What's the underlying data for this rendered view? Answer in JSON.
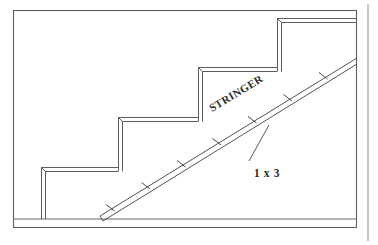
{
  "diagram": {
    "type": "architectural-section",
    "canvas": {
      "width": 378,
      "height": 245,
      "background": "#ffffff"
    },
    "labels": {
      "stringer": "STRINGER",
      "lumber_size": "1 x 3"
    },
    "colors": {
      "frame": "#5d5d5d",
      "page_rule": "#9a9a9a",
      "floor": "#6b6b6b",
      "step_board": "#4a4a4a",
      "stringer": "#3f3f3f",
      "tick": "#2f2f2f",
      "text": "#2b2b2b"
    },
    "frame": {
      "x": 13,
      "y": 10,
      "width": 344,
      "height": 218
    },
    "page_rule": {
      "x": 368,
      "y1": 4,
      "y2": 241
    },
    "floor": {
      "x1": 14,
      "x2": 356,
      "y": 219
    },
    "steps": [
      {
        "name": "step-1",
        "riser_x": 41,
        "riser_top": 167,
        "riser_bottom": 219,
        "tread_y": 167,
        "tread_x2": 118
      },
      {
        "name": "step-2",
        "riser_x": 118,
        "riser_top": 117,
        "riser_bottom": 167,
        "tread_y": 117,
        "tread_x2": 198
      },
      {
        "name": "step-3",
        "riser_x": 198,
        "riser_top": 67,
        "riser_bottom": 117,
        "tread_y": 67,
        "tread_x2": 277
      },
      {
        "name": "step-4",
        "riser_x": 277,
        "riser_top": 18,
        "riser_bottom": 67,
        "tread_y": 18,
        "tread_x2": 357
      }
    ],
    "board_thickness_px": 4,
    "stringer": {
      "start": {
        "x": 100,
        "y": 220
      },
      "end": {
        "x": 357,
        "y": 60
      },
      "thickness_px": 5,
      "tick_count": 7
    },
    "leader": {
      "from": {
        "x": 249,
        "y": 160
      },
      "to": {
        "x": 268,
        "y": 126
      }
    },
    "stringer_label_position": {
      "x": 212,
      "y": 112,
      "rotation_deg": -31
    },
    "size_label_position": {
      "x": 254,
      "y": 175
    }
  }
}
